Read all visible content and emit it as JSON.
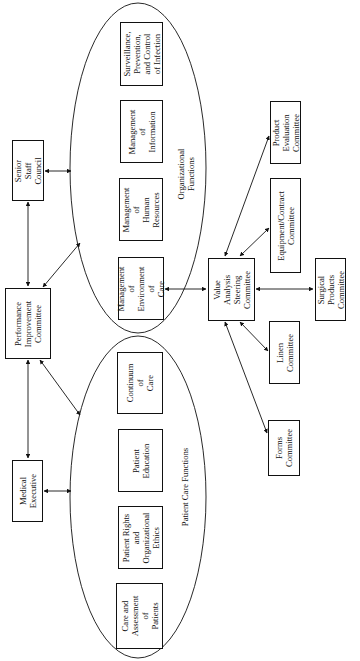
{
  "diagram": {
    "leadership": {
      "senior_staff": "Senior Staff\nCouncil",
      "performance": "Performance\nImprovement\nCommittee",
      "medical_exec": "Medical\nExecutive"
    },
    "organizational_functions": {
      "label": "Organizational\nFunctions",
      "items": [
        "Surveillance,\nPrevention,\nand Control\nof Infection",
        "Management of\nInformation",
        "Management of\nHuman\nResources",
        "Management of\nEnvironment of\nCare"
      ]
    },
    "patient_care_functions": {
      "label": "Patient Care Functions",
      "items": [
        "Continuum of\nCare",
        "Patient\nEducation",
        "Patient Rights\nand\nOrganizational\nEthics",
        "Care and\nAssessment of\nPatients"
      ]
    },
    "value_analysis": {
      "steering": "Value Analysis\nSteering\nCommittee",
      "product_eval": "Product\nEvaluation\nCommittee",
      "equipment": "Equipment/Contract\nCommittee",
      "surgical": "Surgical\nProducts\nCommittee",
      "linen": "Linen\nCommittee",
      "forms": "Forms\nCommittee"
    },
    "colors": {
      "line": "#111111",
      "background": "#ffffff"
    }
  }
}
